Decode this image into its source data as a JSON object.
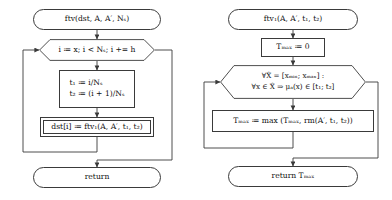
{
  "diagram": {
    "type": "flowchart",
    "title": "",
    "orientation": "two parallel top-down flowcharts",
    "charts": [
      {
        "id": "ftv",
        "name": "ftv-flowchart",
        "nodes": [
          {
            "id": "ftv-start",
            "shape": "terminal",
            "text": "ftv(dst, A, A′, Nₛ)"
          },
          {
            "id": "ftv-loop",
            "shape": "hexagon",
            "text": "i ≔ x; i < Nₛ; i += h"
          },
          {
            "id": "ftv-assign",
            "shape": "process",
            "lines": [
              "t₁ ≔ i/Nₛ",
              "t₂ ≔ (i + 1)/Nₛ"
            ]
          },
          {
            "id": "ftv-call",
            "shape": "subroutine",
            "text": "dst[i] ≔ ftv₁(A, A′, t₁, t₂)"
          },
          {
            "id": "ftv-return",
            "shape": "terminal",
            "text": "return"
          }
        ]
      },
      {
        "id": "ftv1",
        "name": "ftv1-flowchart",
        "nodes": [
          {
            "id": "ftv1-start",
            "shape": "terminal",
            "text": "ftv₁(A, A′, t₁, t₂)"
          },
          {
            "id": "ftv1-init",
            "shape": "process",
            "text": "Tₘₐₓ ≔ 0"
          },
          {
            "id": "ftv1-loop",
            "shape": "hexagon",
            "lines": [
              "∀X̂ = [xₘᵢₙ; xₘₐₓ] :",
              "∀x ∈ X̂ ⇒ μₐ(x) ∈ [t₁; t₂]"
            ]
          },
          {
            "id": "ftv1-body",
            "shape": "process",
            "text": "Tₘₐₓ ≔ max (Tₘₐₓ, rm(A′, t₁, t₂))"
          },
          {
            "id": "ftv1-return",
            "shape": "terminal",
            "text": "return Tₘₐₓ"
          }
        ]
      }
    ],
    "edges_note": "each loop hexagon has a back-edge entering its left vertex and an exit edge leaving its right vertex down to the return terminal"
  },
  "style": {
    "stroke": "#3a3a3a",
    "background": "#ffffff",
    "text": "#111111"
  }
}
